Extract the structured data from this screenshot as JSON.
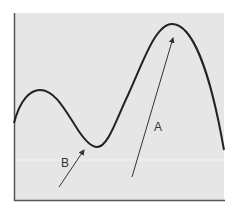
{
  "diagram": {
    "type": "curve-with-arrows",
    "background_color": "#e6e6e6",
    "frame_color": "#555555",
    "curve_color": "#222222",
    "arrow_color": "#333333",
    "curve_description": "Curve with a local maximum at left, a local minimum (B), and a global maximum (A) at right",
    "labels": {
      "a": "A",
      "b": "B"
    },
    "curve_points": [
      [
        14,
        123
      ],
      [
        40,
        90
      ],
      [
        95,
        147
      ],
      [
        173,
        24
      ],
      [
        224,
        150
      ]
    ],
    "arrows": [
      {
        "label": "B",
        "from": [
          59,
          187
        ],
        "to": [
          84,
          149
        ],
        "points_to": "local minimum"
      },
      {
        "label": "A",
        "from": [
          132,
          177
        ],
        "to": [
          173,
          37
        ],
        "points_to": "global maximum"
      }
    ]
  }
}
